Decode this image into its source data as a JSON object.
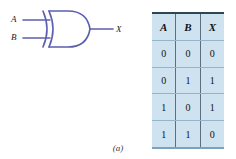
{
  "figure": {
    "caption": "(a)",
    "line_color": "#5c5fb0",
    "table_fill": "#cfe2ef",
    "table_rule_color": "#5b6f80",
    "text_color": "#111111"
  },
  "gate": {
    "type": "xor-gate",
    "name": "XOR",
    "inputs": [
      {
        "label": "A"
      },
      {
        "label": "B"
      }
    ],
    "output": {
      "label": "X"
    }
  },
  "truth_table": {
    "headers": [
      "A",
      "B",
      "X"
    ],
    "rows": [
      [
        "0",
        "0",
        "0"
      ],
      [
        "0",
        "1",
        "1"
      ],
      [
        "1",
        "0",
        "1"
      ],
      [
        "1",
        "1",
        "0"
      ]
    ]
  }
}
